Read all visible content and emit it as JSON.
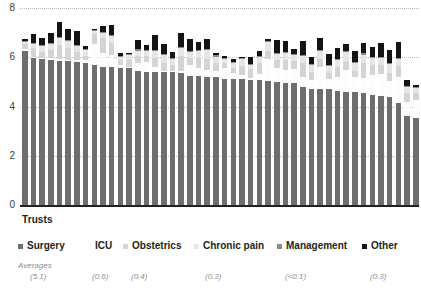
{
  "axis": {
    "x_title": "Trusts",
    "y_ticks": [
      "8",
      "6",
      "4",
      "2",
      "0"
    ]
  },
  "legend": {
    "items": [
      {
        "label": "Surgery",
        "color": "#6e6e6e",
        "average": "(5.1)",
        "left": 18,
        "avg_left": 30
      },
      {
        "label": "ICU",
        "color": "#fdfdfd",
        "average": "(0.6)",
        "left": 86,
        "avg_left": 92
      },
      {
        "label": "Obstetrics",
        "color": "#d4d4d4",
        "average": "(0.4)",
        "left": 123,
        "avg_left": 131
      },
      {
        "label": "Chronic pain",
        "color": "#e6e6e6",
        "average": "(0.3)",
        "left": 194,
        "avg_left": 205
      },
      {
        "label": "Management",
        "color": "#8a8a8a",
        "average": "(<0.1)",
        "left": 277,
        "avg_left": 285
      },
      {
        "label": "Other",
        "color": "#141414",
        "average": "(0.3)",
        "left": 362,
        "avg_left": 370
      }
    ],
    "averages_title": "Averages"
  },
  "chart_data": {
    "type": "bar",
    "stacked": true,
    "title": "",
    "xlabel": "Trusts",
    "ylabel": "",
    "ylim": [
      0,
      8
    ],
    "yticks": [
      0,
      2,
      4,
      6,
      8
    ],
    "grid": true,
    "legend_position": "bottom",
    "categories_note": "46 anonymous NHS trusts, ordered by descending Surgery value",
    "series": [
      {
        "name": "Surgery",
        "color": "#6e6e6e",
        "average": 5.1,
        "values": [
          6.25,
          5.95,
          5.92,
          5.88,
          5.85,
          5.85,
          5.82,
          5.78,
          5.7,
          5.62,
          5.6,
          5.58,
          5.55,
          5.45,
          5.42,
          5.42,
          5.4,
          5.4,
          5.38,
          5.25,
          5.22,
          5.2,
          5.18,
          5.12,
          5.1,
          5.1,
          5.08,
          5.08,
          5.05,
          5.0,
          4.95,
          4.95,
          4.78,
          4.72,
          4.7,
          4.7,
          4.65,
          4.6,
          4.58,
          4.55,
          4.48,
          4.42,
          4.38,
          4.15,
          3.6,
          3.55
        ]
      },
      {
        "name": "ICU",
        "color": "#fdfdfd",
        "average": 0.6,
        "values": [
          0.1,
          0.05,
          0.05,
          0.08,
          0.08,
          0.05,
          0.05,
          0.1,
          0.85,
          0.55,
          0.48,
          0.12,
          0.05,
          0.32,
          0.4,
          0.2,
          0.05,
          0.05,
          0.08,
          0.42,
          0.35,
          0.28,
          0.25,
          0.45,
          0.28,
          0.2,
          0.08,
          0.25,
          0.9,
          0.55,
          0.55,
          0.58,
          0.42,
          0.35,
          0.92,
          0.4,
          0.55,
          0.9,
          0.62,
          0.6,
          0.8,
          0.9,
          0.65,
          1.05,
          0.6,
          0.7
        ]
      },
      {
        "name": "Obstetrics",
        "color": "#d4d4d4",
        "average": 0.4,
        "values": [
          0.18,
          0.38,
          0.25,
          0.35,
          0.55,
          0.48,
          0.35,
          0.18,
          0.38,
          0.62,
          0.52,
          0.18,
          0.3,
          0.28,
          0.25,
          0.35,
          0.3,
          0.25,
          0.6,
          0.32,
          0.4,
          0.45,
          0.35,
          0.2,
          0.2,
          0.35,
          0.38,
          0.42,
          0.3,
          0.35,
          0.4,
          0.3,
          0.55,
          0.32,
          0.3,
          0.28,
          0.4,
          0.32,
          0.25,
          0.6,
          0.4,
          0.38,
          0.35,
          0.45,
          0.35,
          0.3
        ]
      },
      {
        "name": "Chronic pain",
        "color": "#e6e6e6",
        "average": 0.3,
        "values": [
          0.08,
          0.18,
          0.22,
          0.22,
          0.3,
          0.28,
          0.25,
          0.22,
          0.12,
          0.18,
          0.25,
          0.12,
          0.18,
          0.22,
          0.18,
          0.3,
          0.35,
          0.22,
          0.3,
          0.22,
          0.3,
          0.35,
          0.25,
          0.18,
          0.2,
          0.28,
          0.15,
          0.28,
          0.38,
          0.22,
          0.28,
          0.25,
          0.32,
          0.28,
          0.35,
          0.28,
          0.3,
          0.38,
          0.32,
          0.35,
          0.3,
          0.28,
          0.35,
          0.3,
          0.25,
          0.2
        ]
      },
      {
        "name": "Management",
        "color": "#8a8a8a",
        "average": 0.05,
        "values": [
          0.04,
          0.04,
          0.06,
          0.04,
          0.04,
          0.05,
          0.04,
          0.04,
          0.04,
          0.04,
          0.05,
          0.04,
          0.04,
          0.05,
          0.04,
          0.04,
          0.05,
          0.04,
          0.04,
          0.05,
          0.04,
          0.04,
          0.06,
          0.04,
          0.04,
          0.05,
          0.04,
          0.04,
          0.05,
          0.04,
          0.04,
          0.05,
          0.04,
          0.06,
          0.04,
          0.04,
          0.05,
          0.04,
          0.04,
          0.06,
          0.04,
          0.04,
          0.05,
          0.04,
          0.04,
          0.04
        ]
      },
      {
        "name": "Other",
        "color": "#141414",
        "average": 0.3,
        "values": [
          0.1,
          0.35,
          0.3,
          0.4,
          0.62,
          0.42,
          0.55,
          0.12,
          0.05,
          0.25,
          0.4,
          0.12,
          0.05,
          0.38,
          0.2,
          0.6,
          0.4,
          0.25,
          0.6,
          0.48,
          0.3,
          0.42,
          0.1,
          0.05,
          0.1,
          0.05,
          0.3,
          0.2,
          0.05,
          0.55,
          0.45,
          0.2,
          0.55,
          0.3,
          0.48,
          0.45,
          0.42,
          0.3,
          0.45,
          0.42,
          0.4,
          0.55,
          0.52,
          0.62,
          0.25,
          0.1
        ]
      }
    ]
  }
}
